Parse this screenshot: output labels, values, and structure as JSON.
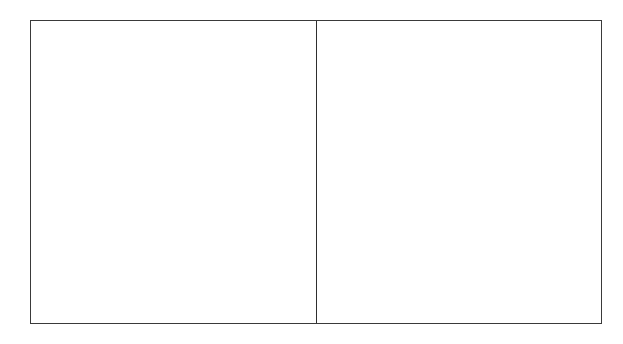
{
  "diagram": {
    "type": "two-panel-frame",
    "panels": [
      {
        "id": "left",
        "label": ""
      },
      {
        "id": "right",
        "label": ""
      }
    ],
    "colors": {
      "border": "#3a3a3a",
      "divider": "#2e2e2e",
      "background": "#ffffff"
    }
  }
}
